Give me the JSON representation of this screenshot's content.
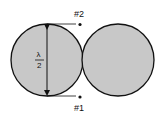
{
  "diagram": {
    "type": "antenna-pattern",
    "shapes": {
      "left_circle": {
        "cx": 47,
        "cy": 60,
        "r": 36
      },
      "right_circle": {
        "cx": 118,
        "cy": 60,
        "r": 36
      }
    },
    "labels": {
      "point_top": "#2",
      "point_bottom": "#1",
      "fraction_numerator": "λ",
      "fraction_denominator": "2"
    },
    "colors": {
      "fill": "#c8c8c8",
      "stroke": "#111111"
    }
  }
}
